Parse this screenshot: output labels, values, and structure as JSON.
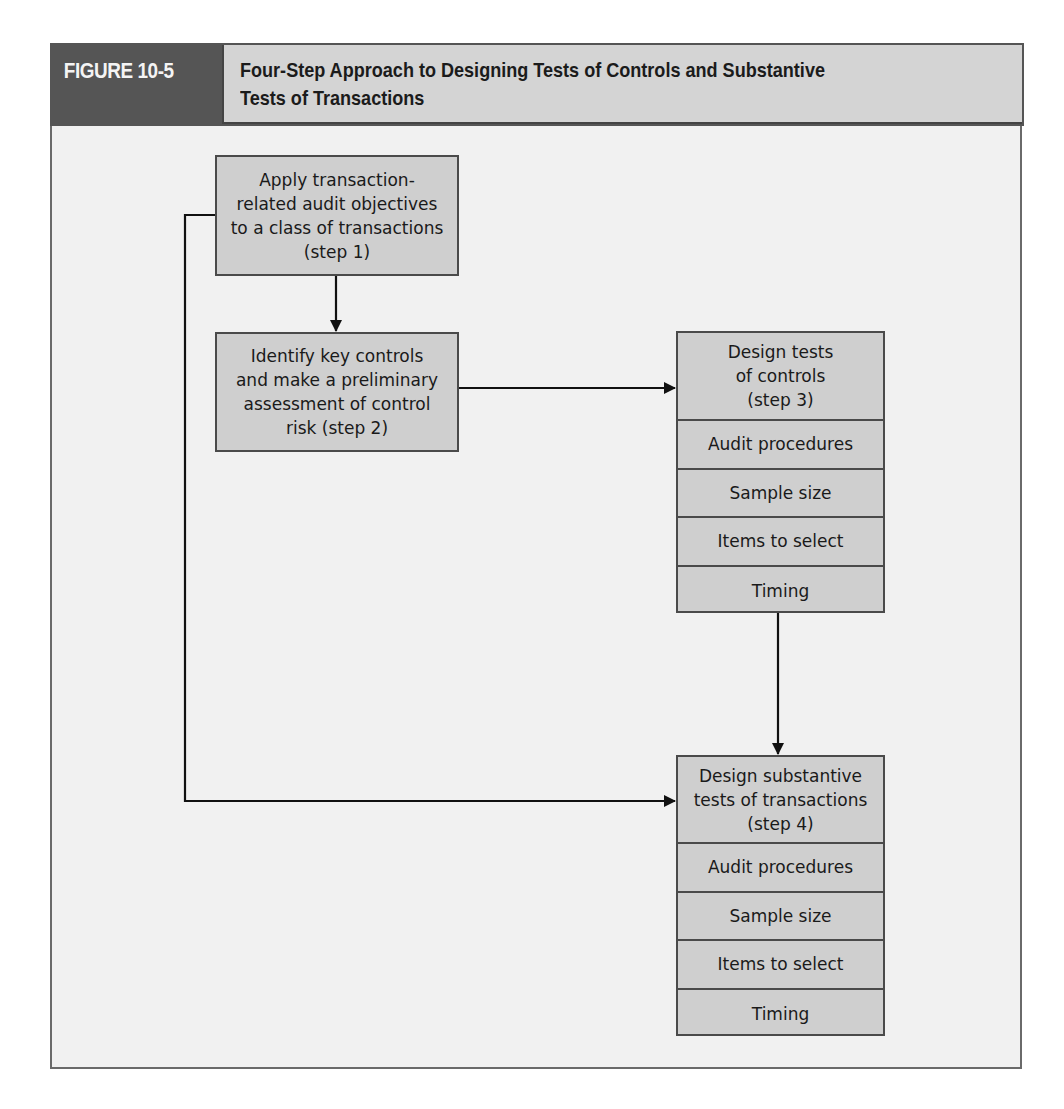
{
  "figure": {
    "label": "FIGURE 10-5",
    "title_line1": "Four-Step Approach to Designing Tests of Controls and Substantive",
    "title_line2": "Tests of Transactions"
  },
  "steps": {
    "step1": {
      "lines": [
        "Apply transaction-",
        "related audit objectives",
        "to a class of transactions",
        "(step 1)"
      ]
    },
    "step2": {
      "lines": [
        "Identify key controls",
        "and make a preliminary",
        "assessment of control",
        "risk (step 2)"
      ]
    },
    "step3": {
      "header_lines": [
        "Design tests",
        "of controls",
        "(step 3)"
      ],
      "rows": [
        "Audit procedures",
        "Sample size",
        "Items to select",
        "Timing"
      ]
    },
    "step4": {
      "header_lines": [
        "Design substantive",
        "tests of transactions",
        "(step 4)"
      ],
      "rows": [
        "Audit procedures",
        "Sample size",
        "Items to select",
        "Timing"
      ]
    }
  },
  "connections": [
    {
      "from": "step1",
      "to": "step2"
    },
    {
      "from": "step2",
      "to": "step3"
    },
    {
      "from": "step3",
      "to": "step4"
    },
    {
      "from": "step1",
      "to": "step4"
    }
  ],
  "colors": {
    "header_dark": "#555555",
    "title_band": "#d4d4d4",
    "box_fill": "#cfcfcf",
    "panel_bg": "#f1f1f1",
    "line": "#111111"
  }
}
